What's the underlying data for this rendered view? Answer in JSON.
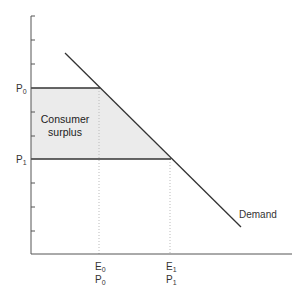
{
  "diagram": {
    "title": "",
    "y_axis": {
      "ticks_y_px": [
        16,
        40,
        64,
        88,
        112,
        136,
        159,
        183,
        207,
        231
      ]
    },
    "price_labels": [
      {
        "main": "P",
        "sub": "0",
        "y": 88
      },
      {
        "main": "P",
        "sub": "1",
        "y": 159
      }
    ],
    "x_labels": [
      {
        "line1_main": "E",
        "line1_sub": "0",
        "line2_main": "P",
        "line2_sub": "0",
        "x": 100
      },
      {
        "line1_main": "E",
        "line1_sub": "1",
        "line2_main": "P",
        "line2_sub": "1",
        "x": 171
      }
    ],
    "demand_label": "Demand",
    "area_label_line1": "Consumer",
    "area_label_line2": "surplus",
    "colors": {
      "axis": "#555555",
      "demand": "#333333",
      "shade": "#ebebeb",
      "guide": "#bbbbbb"
    }
  }
}
